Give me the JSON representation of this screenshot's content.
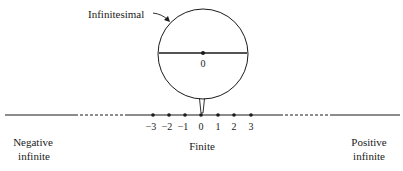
{
  "diagram": {
    "infinitesimal_label": "Infinitesimal",
    "magnified_zero_label": "0",
    "tick_labels": [
      "-3",
      "-2",
      "-1",
      "0",
      "1",
      "2",
      "3"
    ],
    "tick_labels_display": [
      "−3",
      "−2",
      "−1",
      "0",
      "1",
      "2",
      "3"
    ],
    "regions": {
      "negative": {
        "line1": "Negative",
        "line2": "infinite"
      },
      "finite": {
        "label": "Finite"
      },
      "positive": {
        "line1": "Positive",
        "line2": "infinite"
      }
    },
    "colors": {
      "ink": "#1a1a1a",
      "background": "#ffffff"
    }
  }
}
